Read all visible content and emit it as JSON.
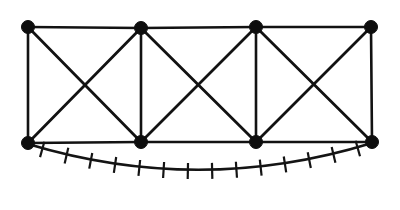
{
  "figure": {
    "kind": "truss-graph-diagram",
    "canvas": {
      "width": 400,
      "height": 210,
      "background": "#ffffff"
    },
    "colors": {
      "ink": "#121212",
      "node_fill": "#0d0d0d",
      "hatch": "#141414",
      "background": "#ffffff"
    },
    "style": {
      "node_radius": 6.5,
      "edge_width": 2.6,
      "diagonal_width": 2.8,
      "hatch_width": 2.2,
      "arc_width": 2.6
    },
    "nodes": [
      {
        "id": "T1",
        "label": "top-left-node",
        "x": 28,
        "y": 27
      },
      {
        "id": "T2",
        "label": "top-second-node",
        "x": 141,
        "y": 28
      },
      {
        "id": "T3",
        "label": "top-third-node",
        "x": 256,
        "y": 27
      },
      {
        "id": "T4",
        "label": "top-right-node",
        "x": 371,
        "y": 27
      },
      {
        "id": "B1",
        "label": "bottom-left-node",
        "x": 28,
        "y": 143
      },
      {
        "id": "B2",
        "label": "bottom-second-node",
        "x": 141,
        "y": 142
      },
      {
        "id": "B3",
        "label": "bottom-third-node",
        "x": 256,
        "y": 142
      },
      {
        "id": "B4",
        "label": "bottom-right-node",
        "x": 372,
        "y": 142
      }
    ],
    "chords": [
      {
        "id": "top-chord-1",
        "from": "T1",
        "to": "T2"
      },
      {
        "id": "top-chord-2",
        "from": "T2",
        "to": "T3"
      },
      {
        "id": "top-chord-3",
        "from": "T3",
        "to": "T4"
      },
      {
        "id": "bottom-chord-1",
        "from": "B1",
        "to": "B2"
      },
      {
        "id": "bottom-chord-2",
        "from": "B2",
        "to": "B3"
      },
      {
        "id": "bottom-chord-3",
        "from": "B3",
        "to": "B4"
      }
    ],
    "verticals": [
      {
        "id": "vertical-1",
        "from": "T1",
        "to": "B1"
      },
      {
        "id": "vertical-2",
        "from": "T2",
        "to": "B2"
      },
      {
        "id": "vertical-3",
        "from": "T3",
        "to": "B3"
      },
      {
        "id": "vertical-4",
        "from": "T4",
        "to": "B4"
      }
    ],
    "diagonals": [
      {
        "id": "panel-1-diagonal-a",
        "from": "T1",
        "to": "B2"
      },
      {
        "id": "panel-1-diagonal-b",
        "from": "B1",
        "to": "T2"
      },
      {
        "id": "panel-2-diagonal-a",
        "from": "T2",
        "to": "B3"
      },
      {
        "id": "panel-2-diagonal-b",
        "from": "B2",
        "to": "T3"
      },
      {
        "id": "panel-3-diagonal-a",
        "from": "T3",
        "to": "B4"
      },
      {
        "id": "panel-3-diagonal-b",
        "from": "B3",
        "to": "T4"
      }
    ],
    "panels": [
      {
        "id": "panel-1",
        "bracing": "X"
      },
      {
        "id": "panel-2",
        "bracing": "X"
      },
      {
        "id": "panel-3",
        "bracing": "X"
      }
    ],
    "support_arc": {
      "id": "ground-support-arc",
      "start": {
        "x": 28,
        "y": 144
      },
      "end": {
        "x": 372,
        "y": 143
      },
      "control": {
        "x": 200,
        "y": 196
      },
      "sag_depth": 27,
      "hatch_tick_count": 14,
      "hatch_tick_length": 16,
      "description": "hatched support arc below bottom chord"
    }
  }
}
